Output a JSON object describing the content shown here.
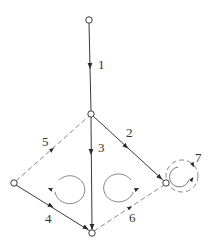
{
  "diagram": {
    "type": "directed-graph",
    "colors": {
      "edge": "#3a3a3a",
      "dashed": "#8a8a8a",
      "node_fill": "#ffffff",
      "node_stroke": "#3a3a3a"
    },
    "nodes": [
      {
        "id": "n-top",
        "x": 89,
        "y": 20
      },
      {
        "id": "n-mid",
        "x": 91,
        "y": 114
      },
      {
        "id": "n-left",
        "x": 14,
        "y": 183
      },
      {
        "id": "n-bottom",
        "x": 92,
        "y": 233
      },
      {
        "id": "n-right",
        "x": 166,
        "y": 183
      }
    ],
    "edges": [
      {
        "label": "1",
        "from": "n-top",
        "to": "n-mid",
        "style": "solid"
      },
      {
        "label": "2",
        "from": "n-mid",
        "to": "n-right",
        "style": "solid"
      },
      {
        "label": "3",
        "from": "n-mid",
        "to": "n-bottom",
        "style": "solid"
      },
      {
        "label": "4",
        "from": "n-left",
        "to": "n-bottom",
        "style": "solid"
      },
      {
        "label": "5",
        "from": "n-left",
        "to": "n-mid",
        "style": "dashed"
      },
      {
        "label": "6",
        "from": "n-bottom",
        "to": "n-right",
        "style": "dashed"
      },
      {
        "label": "7",
        "from": "n-right",
        "to": "n-right",
        "style": "dashed-loop"
      }
    ],
    "loops": [
      {
        "id": "loop-left",
        "direction": "clockwise"
      },
      {
        "id": "loop-right",
        "direction": "counter-clockwise"
      }
    ]
  }
}
